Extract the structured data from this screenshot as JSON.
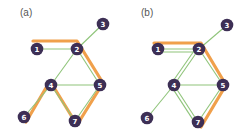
{
  "colors": {
    "node_fill": "#3d2f55",
    "node_text": "#ffffff",
    "edge_green": "#8fc47a",
    "path_orange": "#f0a04b",
    "label": "#555555",
    "background": "#ffffff"
  },
  "panels": [
    {
      "label": "(a)",
      "label_pos": [
        20,
        16
      ],
      "nodes": [
        {
          "id": "1",
          "x": 37,
          "y": 49
        },
        {
          "id": "2",
          "x": 77,
          "y": 49
        },
        {
          "id": "3",
          "x": 103,
          "y": 24
        },
        {
          "id": "4",
          "x": 51,
          "y": 85
        },
        {
          "id": "5",
          "x": 100,
          "y": 85
        },
        {
          "id": "6",
          "x": 24,
          "y": 117
        },
        {
          "id": "7",
          "x": 75,
          "y": 121
        }
      ],
      "edges": [
        [
          "1",
          "2"
        ],
        [
          "2",
          "3"
        ],
        [
          "2",
          "4"
        ],
        [
          "2",
          "5"
        ],
        [
          "4",
          "5"
        ],
        [
          "4",
          "6"
        ],
        [
          "4",
          "7"
        ],
        [
          "5",
          "7"
        ]
      ],
      "highlight_path": [
        "1",
        "2",
        "5",
        "7",
        "4",
        "6"
      ]
    },
    {
      "label": "(b)",
      "label_pos": [
        141,
        16
      ],
      "nodes": [
        {
          "id": "1",
          "x": 158,
          "y": 49
        },
        {
          "id": "2",
          "x": 199,
          "y": 49
        },
        {
          "id": "3",
          "x": 227,
          "y": 25
        },
        {
          "id": "4",
          "x": 174,
          "y": 85
        },
        {
          "id": "5",
          "x": 223,
          "y": 85
        },
        {
          "id": "6",
          "x": 147,
          "y": 118
        },
        {
          "id": "7",
          "x": 198,
          "y": 122
        }
      ],
      "edges": [
        [
          "1",
          "2"
        ],
        [
          "2",
          "3"
        ],
        [
          "2",
          "4"
        ],
        [
          "2",
          "5"
        ],
        [
          "4",
          "5"
        ],
        [
          "4",
          "6"
        ],
        [
          "4",
          "7"
        ],
        [
          "5",
          "7"
        ]
      ],
      "doubled_edges": [
        [
          "1",
          "2"
        ],
        [
          "2",
          "4"
        ],
        [
          "4",
          "7"
        ]
      ],
      "highlight_path": [
        "1",
        "2",
        "5",
        "7"
      ]
    }
  ]
}
